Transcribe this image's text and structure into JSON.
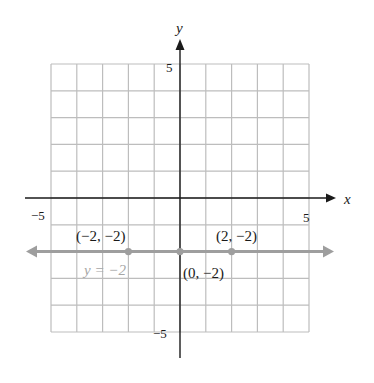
{
  "chart_data": {
    "type": "line",
    "title": "",
    "xlabel": "x",
    "ylabel": "y",
    "xlim": [
      -5,
      5
    ],
    "ylim": [
      -5,
      5
    ],
    "grid": true,
    "x_tick_labels": [
      {
        "value": -5,
        "text": "−5"
      },
      {
        "value": 5,
        "text": "5"
      }
    ],
    "y_tick_labels": [
      {
        "value": 5,
        "text": "5"
      },
      {
        "value": -5,
        "text": "−5"
      }
    ],
    "series": [
      {
        "name": "y = −2",
        "equation_label": "y = −2",
        "kind": "horizontal-line-with-arrows",
        "y": -2,
        "color": "#9e9e9e",
        "points": [
          {
            "x": -2,
            "y": -2,
            "label": "(−2, −2)"
          },
          {
            "x": 0,
            "y": -2,
            "label": "(0, −2)"
          },
          {
            "x": 2,
            "y": -2,
            "label": "(2, −2)"
          }
        ]
      }
    ]
  },
  "colors": {
    "grid": "#bdbdbd",
    "axis": "#1a1a1a",
    "line": "#9e9e9e"
  }
}
